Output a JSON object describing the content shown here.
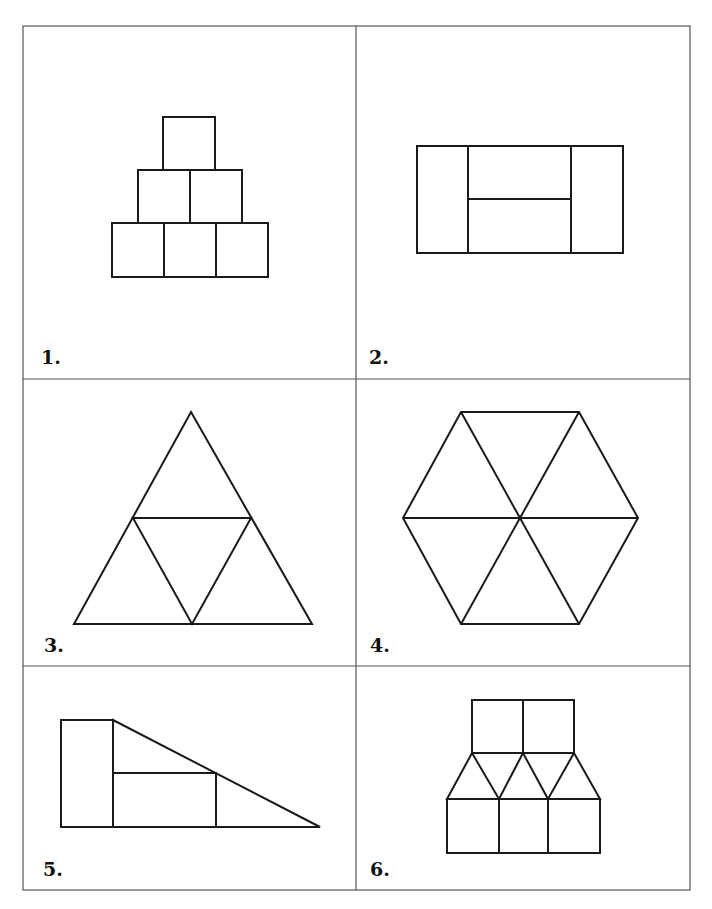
{
  "worksheet": {
    "panels": [
      {
        "label": "1.",
        "description": "Pyramid of six squares: 1 on top, 2 in middle, 3 on bottom"
      },
      {
        "label": "2.",
        "description": "Rectangle split into two tall side rectangles and two stacked middle rectangles"
      },
      {
        "label": "3.",
        "description": "Large triangle divided into four smaller triangles"
      },
      {
        "label": "4.",
        "description": "Hexagon divided into six triangles"
      },
      {
        "label": "5.",
        "description": "Tall rectangle beside a right triangle containing a rectangle and two triangles"
      },
      {
        "label": "6.",
        "description": "Two squares on top, four triangles in middle row, three squares on bottom"
      }
    ]
  }
}
